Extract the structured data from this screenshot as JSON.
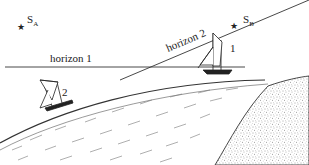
{
  "diagram": {
    "stars": [
      {
        "id": "S_A",
        "main": "S",
        "sub": "A"
      },
      {
        "id": "S_B",
        "main": "S",
        "sub": "B"
      }
    ],
    "horizons": [
      {
        "id": "horizon-1",
        "label": "horizon 1"
      },
      {
        "id": "horizon-2",
        "label": "horizon 2"
      }
    ],
    "ships": [
      {
        "id": "ship-1",
        "label": "1"
      },
      {
        "id": "ship-2",
        "label": "2"
      }
    ],
    "colors": {
      "line": "#333333",
      "background": "#ffffff"
    }
  }
}
